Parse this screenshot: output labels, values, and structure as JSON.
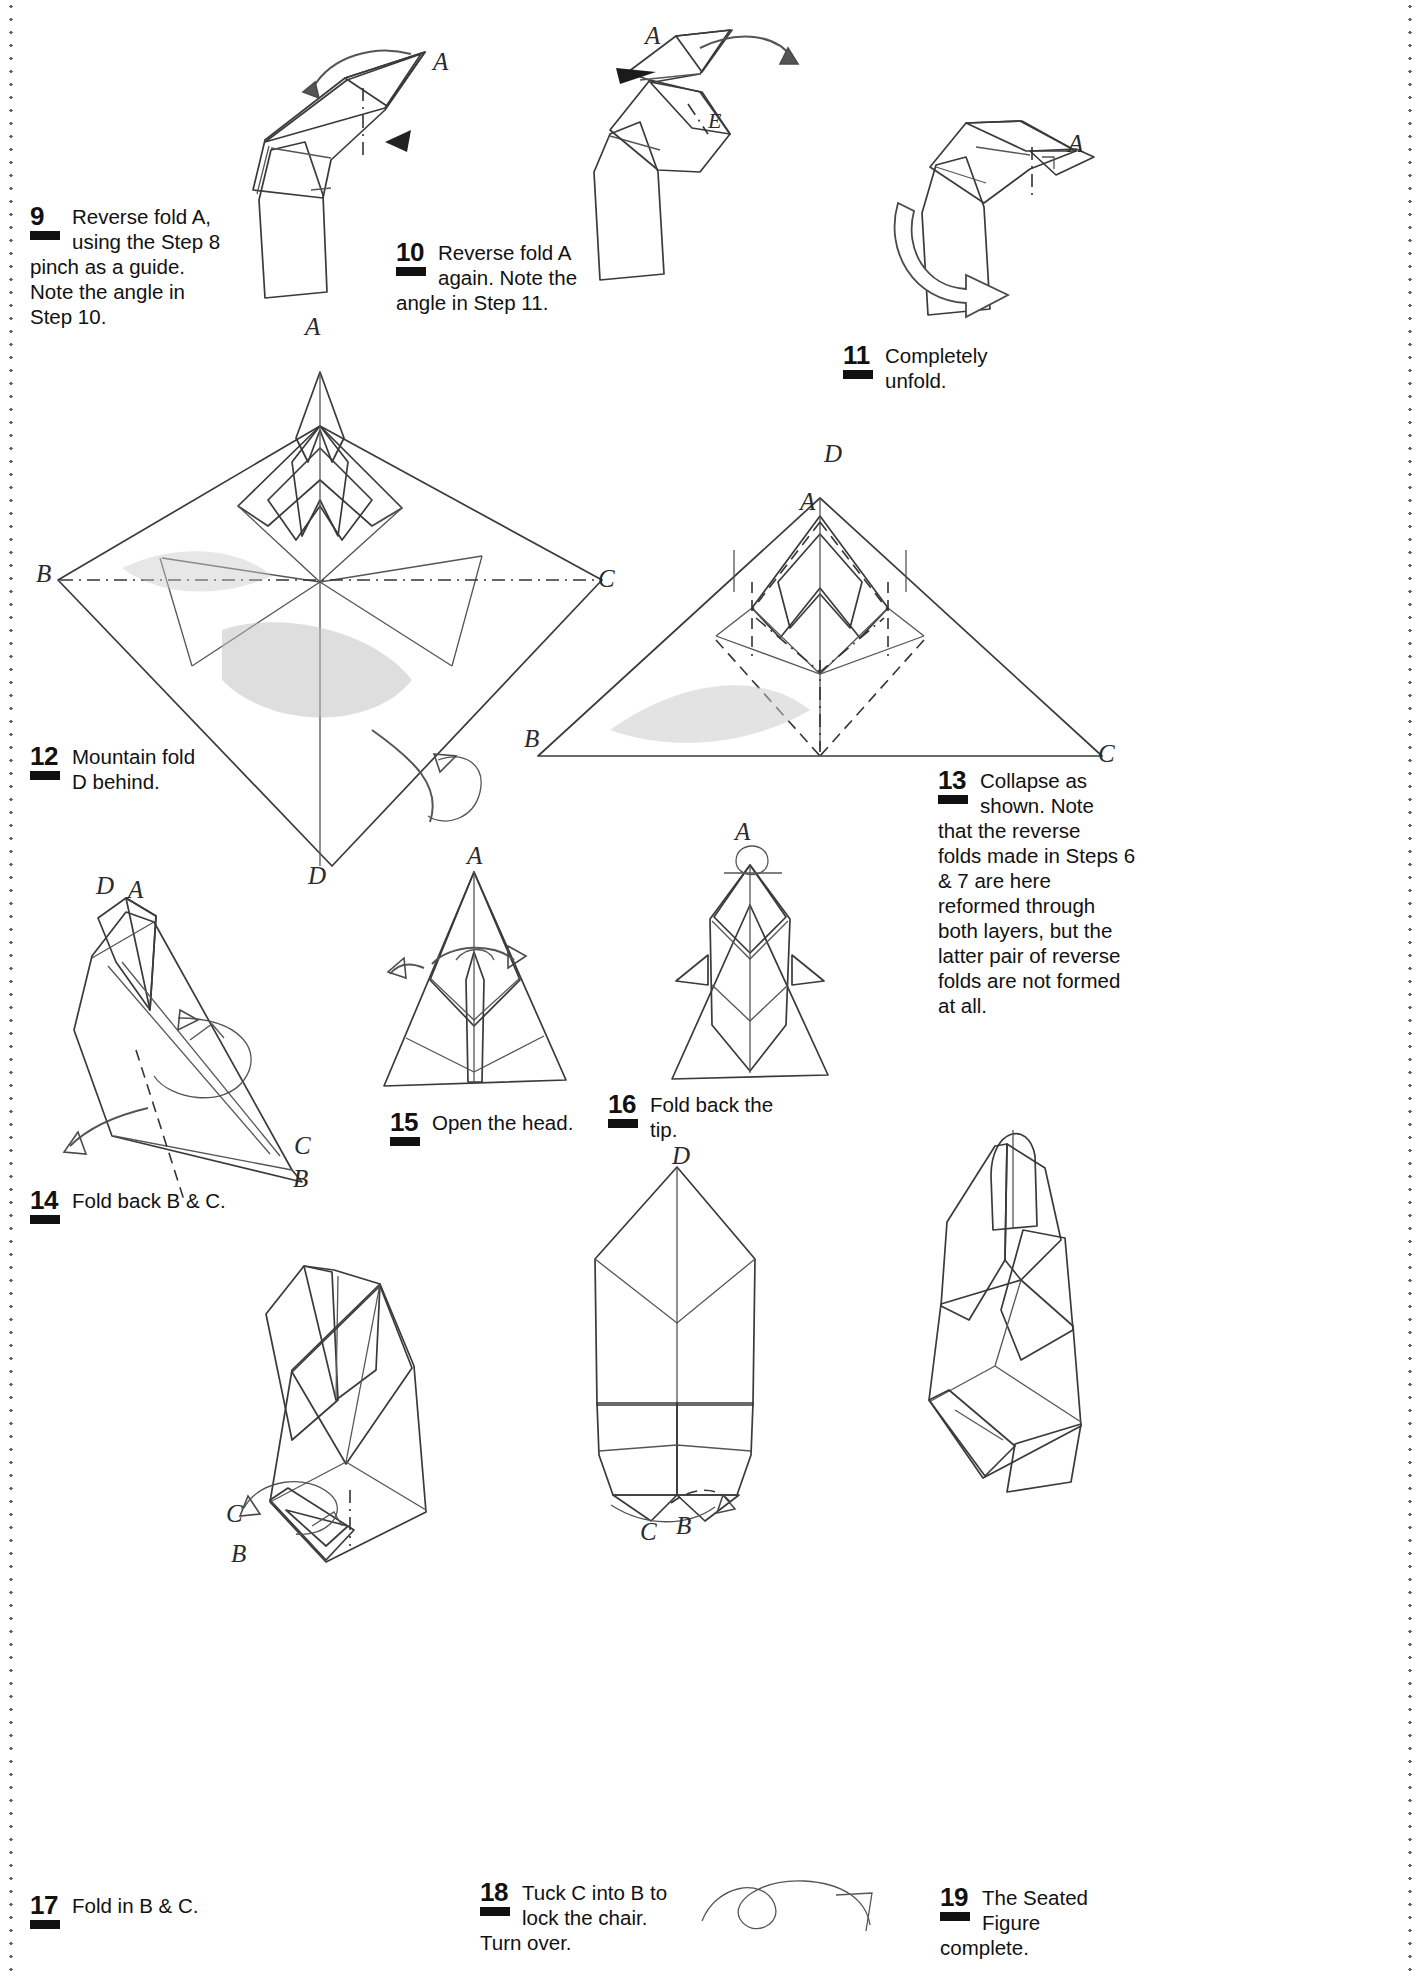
{
  "page": {
    "background": "#ffffff",
    "ink": "#111111"
  },
  "steps": [
    {
      "id": "step-9",
      "number": "9",
      "lines": [
        "Reverse fold A,",
        "using the Step 8",
        "pinch as a guide.",
        "Note the angle in",
        "Step 10."
      ],
      "text": "Reverse fold A, using the Step 8 pinch as a guide. Note the angle in Step 10."
    },
    {
      "id": "step-10",
      "number": "10",
      "lines": [
        "Reverse fold A",
        "again. Note the",
        "angle in Step 11."
      ],
      "text": "Reverse fold A again. Note the angle in Step 11."
    },
    {
      "id": "step-11",
      "number": "11",
      "lines": [
        "Completely",
        "unfold."
      ],
      "text": "Completely unfold."
    },
    {
      "id": "step-12",
      "number": "12",
      "lines": [
        "Mountain fold",
        "D behind."
      ],
      "text": "Mountain fold D behind."
    },
    {
      "id": "step-13",
      "number": "13",
      "lines": [
        "Collapse as",
        "shown. Note",
        "that the reverse",
        "folds made in Steps 6",
        "& 7 are here",
        "reformed through",
        "both layers, but the",
        "latter pair of reverse",
        "folds are not formed",
        "at all."
      ],
      "text": "Collapse as shown. Note that the reverse folds made in Steps 6 & 7 are here reformed through both layers, but the latter pair of reverse folds are not formed at all."
    },
    {
      "id": "step-14",
      "number": "14",
      "lines": [
        "Fold back B & C."
      ],
      "text": "Fold back B & C."
    },
    {
      "id": "step-15",
      "number": "15",
      "lines": [
        "Open the head."
      ],
      "text": "Open the head."
    },
    {
      "id": "step-16",
      "number": "16",
      "lines": [
        "Fold back the",
        "tip."
      ],
      "text": "Fold back the tip."
    },
    {
      "id": "step-17",
      "number": "17",
      "lines": [
        "Fold in B & C."
      ],
      "text": "Fold in B & C."
    },
    {
      "id": "step-18",
      "number": "18",
      "lines": [
        "Tuck C into B to",
        "lock the chair.",
        "Turn over."
      ],
      "text": "Tuck C into B to lock the chair. Turn over."
    },
    {
      "id": "step-19",
      "number": "19",
      "lines": [
        "The Seated",
        "Figure",
        "complete."
      ],
      "text": "The Seated Figure complete."
    }
  ],
  "point_labels": {
    "d9_A": "A",
    "d10_A": "A",
    "d10_E": "E",
    "d11_A": "A",
    "d12_A": "A",
    "d12_B": "B",
    "d12_C": "C",
    "d12_D": "D",
    "d13_A": "A",
    "d13_B": "B",
    "d13_C": "C",
    "d13_D": "D",
    "d14_A": "A",
    "d14_B": "B",
    "d14_C": "C",
    "d14_D": "D",
    "d15_A": "A",
    "d16_A": "A",
    "d17_B": "B",
    "d17_C": "C",
    "d18_D": "D",
    "d18_B": "B",
    "d18_C": "C"
  },
  "colors": {
    "paper_light": "#e9e9e9",
    "paper_mid": "#cfcfcf",
    "paper_dark": "#b4b4b4",
    "paper_shadow": "#9d9d9d",
    "line": "#3a3a3a",
    "rule_dot": "#4b4b4b"
  }
}
